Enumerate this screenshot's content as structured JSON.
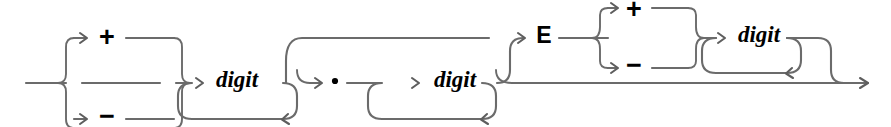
{
  "diagram": {
    "kind": "railroad-syntax-diagram",
    "title": "",
    "background_color": "#ffffff",
    "rail_color": "#6b6b6b",
    "label_color": "#000000",
    "entry_label": "",
    "exit_label": "",
    "terminals": {
      "plus_sign": "+",
      "minus_sign": "−",
      "decimal_point": "·",
      "exponent_marker": "E"
    },
    "nonterminals": {
      "digit": "digit"
    },
    "nodes": [
      {
        "id": "sign-1-plus",
        "type": "terminal",
        "label": "+",
        "row": "upper",
        "group": "mantissa-sign"
      },
      {
        "id": "sign-1-minus",
        "type": "terminal",
        "label": "−",
        "row": "lower",
        "group": "mantissa-sign"
      },
      {
        "id": "digit-1",
        "type": "nonterminal",
        "label": "digit",
        "row": "main",
        "group": "integer-part",
        "repeatable": true
      },
      {
        "id": "point",
        "type": "terminal",
        "label": "·",
        "row": "main",
        "group": "fraction-part"
      },
      {
        "id": "digit-2",
        "type": "nonterminal",
        "label": "digit",
        "row": "main",
        "group": "fraction-part",
        "repeatable": true
      },
      {
        "id": "exp-marker",
        "type": "terminal",
        "label": "E",
        "row": "upper",
        "group": "exponent"
      },
      {
        "id": "sign-2-plus",
        "type": "terminal",
        "label": "+",
        "row": "top",
        "group": "exponent-sign"
      },
      {
        "id": "sign-2-minus",
        "type": "terminal",
        "label": "−",
        "row": "upper2",
        "group": "exponent-sign"
      },
      {
        "id": "digit-3",
        "type": "nonterminal",
        "label": "digit",
        "row": "upper",
        "group": "exponent-digits",
        "repeatable": true
      }
    ],
    "groups": [
      {
        "id": "mantissa-sign",
        "optional": true,
        "choice": [
          "+",
          "−",
          "(none)"
        ]
      },
      {
        "id": "integer-part",
        "optional": false,
        "repeat": true
      },
      {
        "id": "fraction-part",
        "optional": true,
        "repeat": true
      },
      {
        "id": "exponent",
        "optional": true
      },
      {
        "id": "exponent-sign",
        "optional": true,
        "choice": [
          "+",
          "−",
          "(none)"
        ]
      },
      {
        "id": "exponent-digits",
        "optional": false,
        "repeat": true
      }
    ]
  }
}
